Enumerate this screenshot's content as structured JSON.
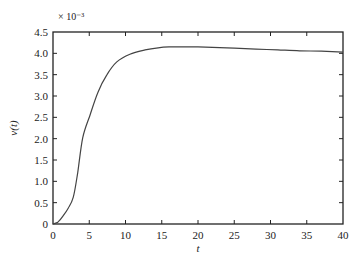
{
  "chart_data": {
    "type": "line",
    "title": "",
    "xlabel": "t",
    "ylabel": "v(t)",
    "y_scale_label": "× 10⁻³",
    "xlim": [
      0,
      40
    ],
    "ylim": [
      0,
      4.5
    ],
    "x_ticks": [
      0,
      5,
      10,
      15,
      20,
      25,
      30,
      35,
      40
    ],
    "y_ticks": [
      0,
      0.5,
      1.0,
      1.5,
      2.0,
      2.5,
      3.0,
      3.5,
      4.0,
      4.5
    ],
    "x_tick_labels": [
      "0",
      "5",
      "10",
      "15",
      "20",
      "25",
      "30",
      "35",
      "40"
    ],
    "y_tick_labels": [
      "0",
      "0.5",
      "1.0",
      "1.5",
      "2.0",
      "2.5",
      "3.0",
      "3.5",
      "4.0",
      "4.5"
    ],
    "grid": false,
    "legend": null,
    "series": [
      {
        "name": "v(t)",
        "color": "#444444",
        "x": [
          0,
          0.7,
          1.4,
          2.1,
          2.8,
          3.4,
          4.1,
          5.1,
          6.2,
          7.4,
          8.8,
          10.6,
          12.7,
          14.5,
          16,
          18,
          20,
          22,
          25,
          28,
          31,
          34,
          37,
          40
        ],
        "y": [
          0,
          0.05,
          0.19,
          0.37,
          0.63,
          1.2,
          2.02,
          2.55,
          3.09,
          3.49,
          3.8,
          3.98,
          4.08,
          4.13,
          4.15,
          4.15,
          4.15,
          4.14,
          4.12,
          4.1,
          4.08,
          4.06,
          4.05,
          4.03
        ]
      }
    ]
  }
}
